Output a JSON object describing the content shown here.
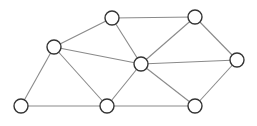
{
  "diagram": {
    "type": "undirected-graph",
    "width": 257,
    "height": 126,
    "node_radius": 7,
    "colors": {
      "background": "#ffffff",
      "edge": "#8a8a8a",
      "node_stroke": "#333333",
      "node_fill": "#ffffff"
    },
    "nodes": [
      {
        "id": "A",
        "x": 112,
        "y": 18
      },
      {
        "id": "B",
        "x": 195,
        "y": 17
      },
      {
        "id": "C",
        "x": 54,
        "y": 47
      },
      {
        "id": "D",
        "x": 141,
        "y": 64
      },
      {
        "id": "E",
        "x": 237,
        "y": 60
      },
      {
        "id": "F",
        "x": 21,
        "y": 106
      },
      {
        "id": "G",
        "x": 107,
        "y": 106
      },
      {
        "id": "H",
        "x": 195,
        "y": 106
      }
    ],
    "edges": [
      [
        "A",
        "B"
      ],
      [
        "A",
        "C"
      ],
      [
        "A",
        "D"
      ],
      [
        "B",
        "D"
      ],
      [
        "B",
        "E"
      ],
      [
        "C",
        "D"
      ],
      [
        "C",
        "F"
      ],
      [
        "C",
        "G"
      ],
      [
        "D",
        "E"
      ],
      [
        "D",
        "G"
      ],
      [
        "D",
        "H"
      ],
      [
        "E",
        "H"
      ],
      [
        "F",
        "G"
      ],
      [
        "G",
        "H"
      ]
    ]
  }
}
